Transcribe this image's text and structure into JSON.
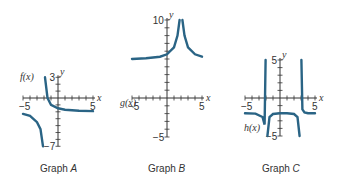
{
  "chart_data": [
    {
      "type": "line",
      "title": "Graph A",
      "caption_prefix": "Graph",
      "caption_letter": "A",
      "function_label": "f(x)",
      "xlabel": "x",
      "ylabel": "y",
      "xlim": [
        -5,
        5
      ],
      "ylim": [
        -7,
        3
      ],
      "tick_labels": {
        "x_min": "−5",
        "x_max": "5",
        "y_max": "3",
        "y_min": "−7"
      },
      "vertical_asymptote": -2,
      "horizontal_asymptote": -2,
      "branches": [
        {
          "x": [
            -5,
            -4,
            -3,
            -2.5,
            -2.15
          ],
          "y": [
            -2.3,
            -2.6,
            -3.5,
            -4.5,
            -7
          ]
        },
        {
          "x": [
            -1.85,
            -1.5,
            -1,
            0,
            1,
            3,
            5
          ],
          "y": [
            3,
            0,
            -1,
            -1.5,
            -1.7,
            -1.85,
            -1.9
          ]
        }
      ]
    },
    {
      "type": "line",
      "title": "Graph B",
      "caption_prefix": "Graph",
      "caption_letter": "B",
      "function_label": "g(x)",
      "xlabel": "x",
      "ylabel": "y",
      "xlim": [
        -5,
        5
      ],
      "ylim": [
        -5,
        10
      ],
      "tick_labels": {
        "x_min": "−5",
        "x_max": "5",
        "y_max": "10",
        "y_min": "−5"
      },
      "vertical_asymptote": 2,
      "horizontal_asymptote": 5,
      "branches": [
        {
          "x": [
            -5,
            -3,
            -1,
            0,
            1,
            1.5,
            1.8
          ],
          "y": [
            5,
            5.1,
            5.3,
            5.6,
            6.5,
            8,
            10
          ]
        },
        {
          "x": [
            2.2,
            2.5,
            3,
            4,
            5
          ],
          "y": [
            10,
            8,
            6.5,
            5.6,
            5.3
          ]
        }
      ]
    },
    {
      "type": "line",
      "title": "Graph C",
      "caption_prefix": "Graph",
      "caption_letter": "C",
      "function_label": "h(x)",
      "xlabel": "x",
      "ylabel": "y",
      "xlim": [
        -5,
        5
      ],
      "ylim": [
        -5,
        5
      ],
      "tick_labels": {
        "x_min": "−5",
        "x_max": "5",
        "y_max": "5",
        "y_min": "−5"
      },
      "vertical_asymptotes": [
        -2,
        3
      ],
      "horizontal_asymptote": -2,
      "branches": [
        {
          "x": [
            -5,
            -3.5,
            -2.5,
            -2.2,
            -2.05
          ],
          "y": [
            -2,
            -2.05,
            -2.5,
            -3.5,
            5
          ]
        },
        {
          "x": [
            -1.8,
            -1.5,
            -1,
            0,
            1,
            2,
            2.5,
            2.8
          ],
          "y": [
            -5,
            -2.5,
            -2.1,
            -2,
            -2,
            -2.1,
            -2.5,
            -5
          ]
        },
        {
          "x": [
            3.05,
            3.2,
            3.5,
            4,
            5
          ],
          "y": [
            5,
            -1.5,
            -1.9,
            -2,
            -2
          ]
        }
      ]
    }
  ]
}
